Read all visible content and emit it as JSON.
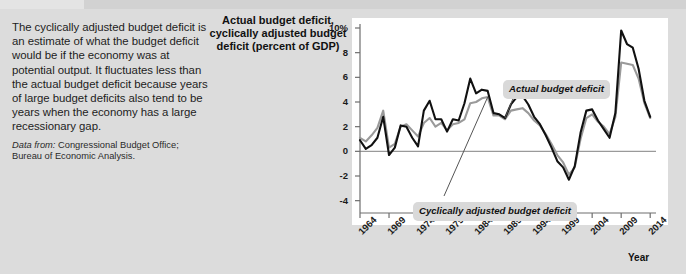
{
  "panel": {
    "body_text": "The cyclically adjusted budget deficit is an estimate of what the budget deficit would be if the economy was at potential output. It fluctuates less than the actual budget deficit because years of large budget deficits also tend to be years when the economy has a large recessionary gap.",
    "source_label": "Data from:",
    "source_text": "Congressional Budget Office; Bureau of Economic Analysis."
  },
  "chart_data": {
    "type": "line",
    "title": "Actual budget deficit, cyclically adjusted budget deficit (percent of GDP)",
    "xlabel": "Year",
    "ylabel": "",
    "xlim": [
      1964,
      2015
    ],
    "ylim": [
      -5,
      10
    ],
    "grid": false,
    "legend_position": "annotations",
    "ytick_labels": [
      "10%",
      "8",
      "6",
      "4",
      "2",
      "0",
      "-2",
      "-4"
    ],
    "ytick_values": [
      10,
      8,
      6,
      4,
      2,
      0,
      -2,
      -4
    ],
    "xtick_labels": [
      "1964",
      "1969",
      "1974",
      "1979",
      "1984",
      "1989",
      "1994",
      "1999",
      "2004",
      "2009",
      "2014"
    ],
    "xtick_values": [
      1964,
      1969,
      1974,
      1979,
      1984,
      1989,
      1994,
      1999,
      2004,
      2009,
      2014
    ],
    "zero_line": 0,
    "annotations": [
      {
        "id": "actual",
        "text": "Actual budget deficit",
        "points_to_year": 1989
      },
      {
        "id": "cyclical",
        "text": "Cyclically adjusted budget deficit",
        "points_to_year": 1986
      }
    ],
    "series": [
      {
        "name": "Actual budget deficit",
        "color": "#111111",
        "x": [
          1964,
          1965,
          1966,
          1967,
          1968,
          1969,
          1970,
          1971,
          1972,
          1973,
          1974,
          1975,
          1976,
          1977,
          1978,
          1979,
          1980,
          1981,
          1982,
          1983,
          1984,
          1985,
          1986,
          1987,
          1988,
          1989,
          1990,
          1991,
          1992,
          1993,
          1994,
          1995,
          1996,
          1997,
          1998,
          1999,
          2000,
          2001,
          2002,
          2003,
          2004,
          2005,
          2006,
          2007,
          2008,
          2009,
          2010,
          2011,
          2012,
          2013,
          2014
        ],
        "values": [
          0.9,
          0.2,
          0.5,
          1.1,
          2.8,
          -0.3,
          0.3,
          2.1,
          2.0,
          1.1,
          0.4,
          3.3,
          4.1,
          2.6,
          2.6,
          1.6,
          2.6,
          2.5,
          3.9,
          5.9,
          4.7,
          5.0,
          4.9,
          3.1,
          3.0,
          2.7,
          3.8,
          4.4,
          4.5,
          3.8,
          2.8,
          2.2,
          1.3,
          0.3,
          -0.8,
          -1.3,
          -2.3,
          -1.2,
          1.5,
          3.3,
          3.4,
          2.5,
          1.8,
          1.1,
          3.1,
          9.8,
          8.7,
          8.4,
          6.7,
          4.1,
          2.8
        ]
      },
      {
        "name": "Cyclically adjusted budget deficit",
        "color": "#9a9a9a",
        "x": [
          1964,
          1965,
          1966,
          1967,
          1968,
          1969,
          1970,
          1971,
          1972,
          1973,
          1974,
          1975,
          1976,
          1977,
          1978,
          1979,
          1980,
          1981,
          1982,
          1983,
          1984,
          1985,
          1986,
          1987,
          1988,
          1989,
          1990,
          1991,
          1992,
          1993,
          1994,
          1995,
          1996,
          1997,
          1998,
          1999,
          2000,
          2001,
          2002,
          2003,
          2004,
          2005,
          2006,
          2007,
          2008,
          2009,
          2010,
          2011,
          2012,
          2013,
          2014
        ],
        "values": [
          1.1,
          0.8,
          1.3,
          1.9,
          3.3,
          0.3,
          0.6,
          2.0,
          2.2,
          1.7,
          1.2,
          2.3,
          2.7,
          2.0,
          2.3,
          1.7,
          2.2,
          2.3,
          2.6,
          3.9,
          4.0,
          4.3,
          4.4,
          2.9,
          2.9,
          2.6,
          3.3,
          3.4,
          3.5,
          3.1,
          2.5,
          2.1,
          1.4,
          0.6,
          -0.3,
          -0.9,
          -1.9,
          -1.3,
          1.0,
          2.7,
          3.0,
          2.4,
          2.0,
          1.4,
          2.8,
          7.2,
          7.1,
          7.0,
          5.9,
          3.9,
          2.7
        ]
      }
    ]
  }
}
